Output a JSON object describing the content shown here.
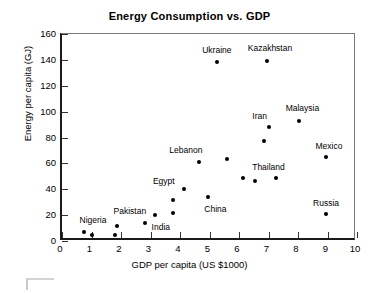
{
  "chart_data": {
    "type": "scatter",
    "title": "Energy Consumption vs. GDP",
    "xlabel": "GDP per capita (US $1000)",
    "ylabel": "Energy per capita (GJ)",
    "xlim": [
      0,
      10
    ],
    "ylim": [
      0,
      160
    ],
    "xticks": [
      "0",
      "1",
      "2",
      "3",
      "4",
      "5",
      "6",
      "7",
      "8",
      "9",
      "10"
    ],
    "yticks": [
      "0",
      "20",
      "40",
      "60",
      "80",
      "100",
      "120",
      "140",
      "160"
    ],
    "grid": false,
    "legend": "none",
    "marker_color": "#000000",
    "points": [
      {
        "label": "Nigeria",
        "x": 0.75,
        "y": 7,
        "label_x": 1.05,
        "label_y": 16.5
      },
      {
        "label": "",
        "x": 1.0,
        "y": 5
      },
      {
        "label": "Pakistan",
        "x": 1.85,
        "y": 11.5,
        "label_x": 2.3,
        "label_y": 23
      },
      {
        "label": "",
        "x": 1.8,
        "y": 4.5
      },
      {
        "label": "India",
        "x": 2.8,
        "y": 14,
        "label_x": 3.35,
        "label_y": 10.5
      },
      {
        "label": "",
        "x": 3.15,
        "y": 20
      },
      {
        "label": "",
        "x": 3.75,
        "y": 21.5
      },
      {
        "label": "",
        "x": 3.75,
        "y": 31.5
      },
      {
        "label": "Egypt",
        "x": 4.15,
        "y": 40.5,
        "label_x": 3.45,
        "label_y": 46.5
      },
      {
        "label": "China",
        "x": 4.95,
        "y": 34,
        "label_x": 5.2,
        "label_y": 24.5
      },
      {
        "label": "Lebanon",
        "x": 4.65,
        "y": 61,
        "label_x": 4.2,
        "label_y": 70
      },
      {
        "label": "",
        "x": 5.6,
        "y": 63
      },
      {
        "label": "Ukraine",
        "x": 5.25,
        "y": 138,
        "label_x": 5.25,
        "label_y": 148
      },
      {
        "label": "Kazakhstan",
        "x": 6.95,
        "y": 139.5,
        "label_x": 7.05,
        "label_y": 149
      },
      {
        "label": "",
        "x": 6.15,
        "y": 48.5
      },
      {
        "label": "",
        "x": 6.55,
        "y": 46.5
      },
      {
        "label": "Thailand",
        "x": 7.25,
        "y": 49,
        "label_x": 7.0,
        "label_y": 57.5
      },
      {
        "label": "",
        "x": 6.85,
        "y": 77.5
      },
      {
        "label": "Iran",
        "x": 7.0,
        "y": 88.5,
        "label_x": 6.7,
        "label_y": 97
      },
      {
        "label": "Malaysia",
        "x": 8.05,
        "y": 93,
        "label_x": 8.15,
        "label_y": 103
      },
      {
        "label": "Mexico",
        "x": 8.95,
        "y": 65,
        "label_x": 9.05,
        "label_y": 73.5
      },
      {
        "label": "Russia",
        "x": 8.95,
        "y": 21,
        "label_x": 8.95,
        "label_y": 29.5
      }
    ]
  }
}
